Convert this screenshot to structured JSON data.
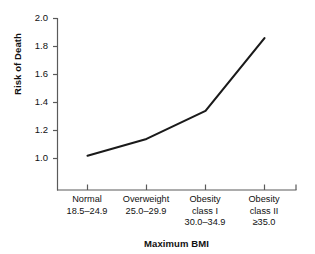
{
  "chart_data": {
    "type": "line",
    "title": "",
    "subtitle": "",
    "xlabel": "Maximum BMI",
    "ylabel": "Risk of Death",
    "categories": [
      "Normal",
      "Overweight",
      "Obesity class I",
      "Obesity class II"
    ],
    "category_lines": [
      [
        "Normal",
        "18.5–24.9"
      ],
      [
        "Overweight",
        "25.0–29.9"
      ],
      [
        "Obesity",
        "class I",
        "30.0–34.9"
      ],
      [
        "Obesity",
        "class II",
        "≥35.0"
      ]
    ],
    "values": [
      1.02,
      1.14,
      1.34,
      1.86
    ],
    "ylim": [
      1.0,
      2.0
    ],
    "yticks": [
      "1.0",
      "1.2",
      "1.4",
      "1.6",
      "1.8",
      "2.0"
    ],
    "ytick_values": [
      1.0,
      1.2,
      1.4,
      1.6,
      1.8,
      2.0
    ],
    "grid": false,
    "legend": null,
    "line_color": "#1a1a1a",
    "background_color": "#ffffff",
    "axis_color": "#5a5a5a"
  },
  "axis": {
    "ytick_0": "1.0",
    "ytick_1": "1.2",
    "ytick_2": "1.4",
    "ytick_3": "1.6",
    "ytick_4": "1.8",
    "ytick_5": "2.0",
    "ylabel": "Risk of Death",
    "xlabel": "Maximum BMI"
  },
  "xcats": {
    "c0_l0": "Normal",
    "c0_l1": "18.5–24.9",
    "c0_l2": "",
    "c1_l0": "Overweight",
    "c1_l1": "25.0–29.9",
    "c1_l2": "",
    "c2_l0": "Obesity",
    "c2_l1": "class I",
    "c2_l2": "30.0–34.9",
    "c3_l0": "Obesity",
    "c3_l1": "class II",
    "c3_l2": "≥35.0"
  }
}
